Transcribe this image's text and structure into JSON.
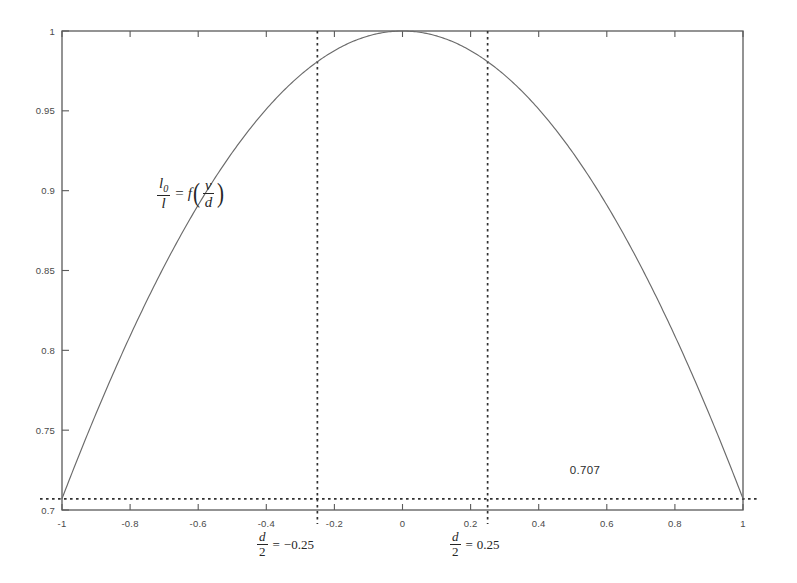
{
  "chart_data": {
    "type": "line",
    "title": "",
    "subtitle": "",
    "xlabel": "",
    "ylabel": "",
    "xlim": [
      -1,
      1
    ],
    "ylim": [
      0.7,
      1
    ],
    "grid": false,
    "legend": null,
    "x_ticks": [
      "-1",
      "-0.8",
      "-0.6",
      "-0.4",
      "-0.2",
      "0",
      "0.2",
      "0.4",
      "0.6",
      "0.8",
      "1"
    ],
    "x_tick_values": [
      -1,
      -0.8,
      -0.6,
      -0.4,
      -0.2,
      0,
      0.2,
      0.4,
      0.6,
      0.8,
      1
    ],
    "y_ticks": [
      "0.7",
      "0.75",
      "0.8",
      "0.85",
      "0.9",
      "0.95",
      "1"
    ],
    "y_tick_values": [
      0.7,
      0.75,
      0.8,
      0.85,
      0.9,
      0.95,
      1
    ],
    "series": [
      {
        "name": "I0/I = f(v/d)",
        "x": [
          -1,
          -0.95,
          -0.9,
          -0.85,
          -0.8,
          -0.75,
          -0.7,
          -0.65,
          -0.6,
          -0.55,
          -0.5,
          -0.45,
          -0.4,
          -0.35,
          -0.3,
          -0.25,
          -0.2,
          -0.15,
          -0.1,
          -0.05,
          0,
          0.05,
          0.1,
          0.15,
          0.2,
          0.25,
          0.3,
          0.35,
          0.4,
          0.45,
          0.5,
          0.55,
          0.6,
          0.65,
          0.7,
          0.75,
          0.8,
          0.85,
          0.9,
          0.95,
          1
        ],
        "y": [
          0.7071,
          0.7242,
          0.7409,
          0.7571,
          0.7727,
          0.7878,
          0.8022,
          0.816,
          0.8291,
          0.8415,
          0.8531,
          0.864,
          0.8742,
          0.8835,
          0.8919,
          0.8995,
          0.9063,
          0.9122,
          0.9172,
          0.9213,
          1.0,
          0.9213,
          0.9172,
          0.9122,
          0.9063,
          0.8995,
          0.8919,
          0.8835,
          0.8742,
          0.864,
          0.8531,
          0.8415,
          0.8291,
          0.816,
          0.8022,
          0.7878,
          0.7727,
          0.7571,
          0.7409,
          0.7242,
          0.7071
        ]
      }
    ],
    "annotations": {
      "curve_formula_numerator": "l",
      "curve_formula_numerator_sub": "0",
      "curve_formula_denominator": "l",
      "curve_formula_equals": "=",
      "curve_formula_function": "f",
      "curve_formula_arg_numerator": "v",
      "curve_formula_arg_denominator": "d",
      "left_marker_numerator": "d",
      "left_marker_denominator": "2",
      "left_marker_equals": "=",
      "left_marker_value": "−0.25",
      "right_marker_numerator": "d",
      "right_marker_denominator": "2",
      "right_marker_equals": "=",
      "right_marker_value": "0.25",
      "threshold_label": "0.707"
    },
    "reference_lines": {
      "vertical": [
        {
          "name": "half-width-left",
          "value": -0.25
        },
        {
          "name": "half-width-right",
          "value": 0.25
        }
      ],
      "horizontal": [
        {
          "name": "half-power-threshold",
          "value": 0.707,
          "label": "0.707"
        }
      ]
    },
    "colors": {
      "curve": "#6b6b6b",
      "frame": "#5a5a5a",
      "dashed": "#303030",
      "text": "#3a3a3a",
      "background": "#ffffff"
    }
  }
}
